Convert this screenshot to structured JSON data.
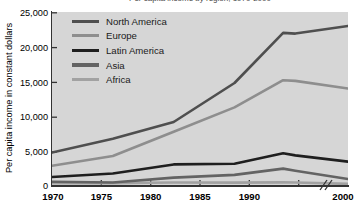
{
  "figure": {
    "title_cropped": "Per capita income by region, 1970-2000",
    "ylabel": "Per capita income in constant dollars",
    "xlabel": ""
  },
  "axes": {
    "y_ticks": [
      "25,000",
      "20,000",
      "15,000",
      "10,000",
      "5,000",
      "0"
    ],
    "x_ticks": [
      "1970",
      "1975",
      "1980",
      "1985",
      "1990",
      "2000"
    ],
    "axis_break_symbol": "//"
  },
  "legend": {
    "items": [
      {
        "label": "North America",
        "color": "#4f4f4f"
      },
      {
        "label": "Europe",
        "color": "#8e8e8e"
      },
      {
        "label": "Latin America",
        "color": "#1f1f1f"
      },
      {
        "label": "Asia",
        "color": "#636363"
      },
      {
        "label": "Africa",
        "color": "#a2a2a2"
      }
    ]
  },
  "colors": {
    "plot_background": "#d6d6d6",
    "axis": "#333333",
    "page_background": "#ffffff"
  },
  "chart_data": {
    "type": "line",
    "title": "Per capita income by region, 1970-2000",
    "xlabel": "",
    "ylabel": "Per capita income in constant dollars",
    "x": [
      1970,
      1975,
      1980,
      1985,
      1989,
      1990,
      2000
    ],
    "xlim": [
      1970,
      2000
    ],
    "ylim": [
      0,
      25000
    ],
    "x_tick_labels": [
      "1970",
      "1975",
      "1980",
      "1985",
      "1990",
      "2000"
    ],
    "y_tick_values": [
      0,
      5000,
      10000,
      15000,
      20000,
      25000
    ],
    "grid": false,
    "legend_position": "upper-left-inside",
    "axis_break": {
      "axis": "x",
      "between": [
        1990,
        2000
      ]
    },
    "series": [
      {
        "name": "North America",
        "color": "#4f4f4f",
        "values": [
          4800,
          6800,
          9200,
          14800,
          22000,
          21900,
          23000
        ]
      },
      {
        "name": "Europe",
        "color": "#8e8e8e",
        "values": [
          2900,
          4300,
          7800,
          11300,
          15200,
          15100,
          14000
        ]
      },
      {
        "name": "Latin America",
        "color": "#1f1f1f",
        "values": [
          1300,
          1800,
          3100,
          3200,
          4700,
          4400,
          3500
        ]
      },
      {
        "name": "Asia",
        "color": "#636363",
        "values": [
          600,
          500,
          1200,
          1600,
          2500,
          2200,
          1000
        ]
      },
      {
        "name": "Africa",
        "color": "#a2a2a2",
        "values": [
          400,
          420,
          500,
          480,
          520,
          500,
          300
        ]
      }
    ]
  }
}
